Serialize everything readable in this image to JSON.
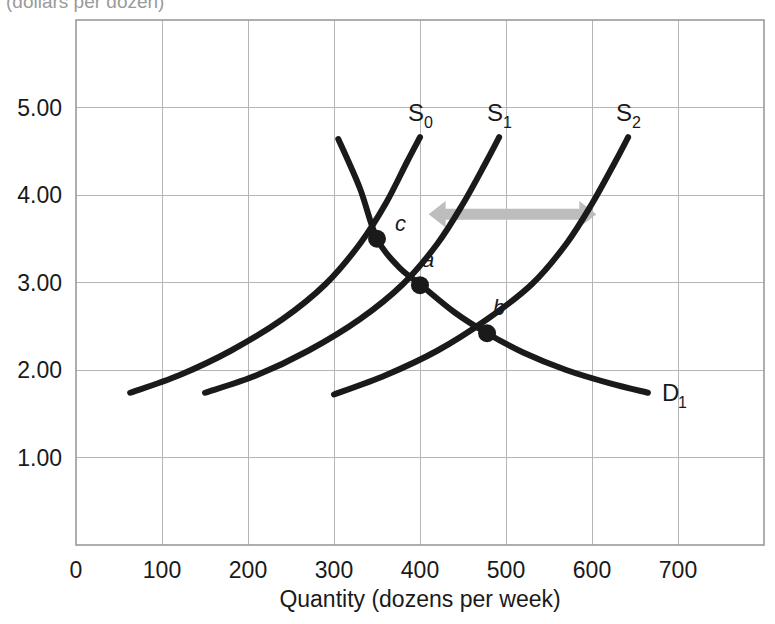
{
  "figure": {
    "partial_top_note": "(dollars per dozen)",
    "background_color": "#ffffff",
    "frame_color": "#9a9a9a",
    "grid_color": "#b5b5b5",
    "curve_color": "#1a1a1a",
    "arrow_color": "#bdbdbd"
  },
  "chart_data": {
    "type": "line",
    "title": "",
    "subtitle": "",
    "xlabel": "Quantity (dozens per week)",
    "ylabel": "",
    "xlim": [
      0,
      800
    ],
    "ylim": [
      0,
      6.0
    ],
    "xticks": [
      0,
      100,
      200,
      300,
      400,
      500,
      600,
      700
    ],
    "xtick_labels": [
      "0",
      "100",
      "200",
      "300",
      "400",
      "500",
      "600",
      "700"
    ],
    "yticks": [
      1.0,
      2.0,
      3.0,
      4.0,
      5.0
    ],
    "ytick_labels": [
      "1.00",
      "2.00",
      "3.00",
      "4.00",
      "5.00"
    ],
    "grid": true,
    "legend": "none",
    "series": [
      {
        "name": "S0",
        "label": "S",
        "subscript": "0",
        "kind": "supply",
        "points": [
          [
            63,
            1.74
          ],
          [
            120,
            1.94
          ],
          [
            180,
            2.22
          ],
          [
            240,
            2.58
          ],
          [
            290,
            2.98
          ],
          [
            330,
            3.44
          ],
          [
            360,
            3.9
          ],
          [
            385,
            4.38
          ],
          [
            400,
            4.66
          ]
        ]
      },
      {
        "name": "S1",
        "label": "S",
        "subscript": "1",
        "kind": "supply",
        "points": [
          [
            150,
            1.74
          ],
          [
            210,
            1.94
          ],
          [
            270,
            2.22
          ],
          [
            330,
            2.58
          ],
          [
            380,
            2.98
          ],
          [
            420,
            3.44
          ],
          [
            450,
            3.9
          ],
          [
            477,
            4.38
          ],
          [
            492,
            4.66
          ]
        ]
      },
      {
        "name": "S2",
        "label": "S",
        "subscript": "2",
        "kind": "supply",
        "points": [
          [
            300,
            1.72
          ],
          [
            360,
            1.94
          ],
          [
            420,
            2.22
          ],
          [
            478,
            2.58
          ],
          [
            530,
            2.98
          ],
          [
            570,
            3.44
          ],
          [
            600,
            3.9
          ],
          [
            627,
            4.38
          ],
          [
            642,
            4.66
          ]
        ]
      },
      {
        "name": "D1",
        "label": "D",
        "subscript": "1",
        "kind": "demand",
        "points": [
          [
            305,
            4.64
          ],
          [
            330,
            4.08
          ],
          [
            350,
            3.5
          ],
          [
            375,
            3.18
          ],
          [
            400,
            2.98
          ],
          [
            440,
            2.66
          ],
          [
            478,
            2.42
          ],
          [
            520,
            2.2
          ],
          [
            570,
            2.0
          ],
          [
            620,
            1.85
          ],
          [
            665,
            1.74
          ]
        ]
      }
    ],
    "points": [
      {
        "id": "c",
        "label": "c",
        "x": 350,
        "y": 3.5,
        "label_dx": 18,
        "label_dy": -8
      },
      {
        "id": "a",
        "label": "a",
        "x": 400,
        "y": 2.97,
        "label_dx": 2,
        "label_dy": -18
      },
      {
        "id": "b",
        "label": "b",
        "x": 478,
        "y": 2.42,
        "label_dx": 6,
        "label_dy": -18
      }
    ],
    "annotations": [
      {
        "id": "shift-arrow",
        "kind": "double-arrow",
        "x_start": 410,
        "x_end": 605,
        "y": 3.78,
        "color": "#bdbdbd"
      }
    ]
  }
}
